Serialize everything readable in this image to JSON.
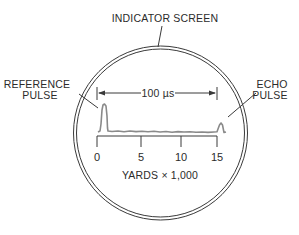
{
  "title_label": "INDICATOR SCREEN",
  "reference_label": {
    "line1": "REFERENCE",
    "line2": "PULSE"
  },
  "echo_label": {
    "line1": "ECHO",
    "line2": "PULSE"
  },
  "interval_label": "100 µs",
  "axis": {
    "ticks": [
      {
        "value": "0"
      },
      {
        "value": "5"
      },
      {
        "value": "10"
      },
      {
        "value": "15"
      }
    ],
    "label": "YARDS × 1,000"
  },
  "colors": {
    "line": "#3a3a3a",
    "trace": "#8a8a8a",
    "text": "#2b2b2b",
    "background": "#ffffff"
  }
}
